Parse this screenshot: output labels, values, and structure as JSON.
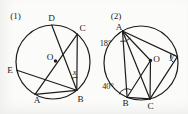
{
  "figure": {
    "background": "#fbfbf9",
    "ink": "#1c1c1c",
    "diagrams": [
      {
        "id": "diagram-1",
        "tag": "(1)",
        "tag_pos": [
          15.5,
          15.5
        ],
        "circle": {
          "cx": 53,
          "cy": 62,
          "r": 37
        },
        "center_dot": [
          55.5,
          61
        ],
        "points": {
          "D": [
            51.7,
            25.0
          ],
          "C": [
            77.3,
            34.1
          ],
          "E": [
            17.0,
            70.3
          ],
          "A": [
            35.1,
            94.4
          ],
          "B": [
            76.8,
            90.3
          ]
        },
        "segments": [
          [
            "D",
            "B"
          ],
          [
            "A",
            "C"
          ],
          [
            "C",
            "B"
          ],
          [
            "E",
            "B"
          ],
          [
            "A",
            "B"
          ]
        ],
        "point_labels": [
          {
            "text": "D",
            "pos": [
              51.5,
              18.0
            ]
          },
          {
            "text": "C",
            "pos": [
              82.5,
              27.5
            ]
          },
          {
            "text": "E",
            "pos": [
              10.0,
              70.0
            ]
          },
          {
            "text": "A",
            "pos": [
              37.0,
              99.5
            ]
          },
          {
            "text": "B",
            "pos": [
              80.5,
              99.0
            ]
          },
          {
            "text": "O",
            "pos": [
              50.0,
              56.5
            ]
          }
        ],
        "angle_marks": [
          {
            "at": "B",
            "from": -113,
            "to": -87,
            "radius": 13,
            "label": "x",
            "label_pos": [
              74.5,
              72.0
            ],
            "italic": true
          }
        ]
      },
      {
        "id": "diagram-2",
        "tag": "(2)",
        "tag_pos": [
          116.0,
          15.5
        ],
        "circle": {
          "cx": 141,
          "cy": 63,
          "r": 37
        },
        "center_dot": [
          150.5,
          60.5
        ],
        "points": {
          "A": [
            122.5,
            31.0
          ],
          "B": [
            127.1,
            97.3
          ],
          "C": [
            150.0,
            98.9
          ],
          "P": [
            177.4,
            56.6
          ],
          "O": [
            150.5,
            60.5
          ]
        },
        "segments": [
          [
            "A",
            "B"
          ],
          [
            "A",
            "C"
          ],
          [
            "A",
            "P"
          ],
          [
            "A",
            "O"
          ],
          [
            "B",
            "O"
          ],
          [
            "B",
            "C"
          ],
          [
            "C",
            "O"
          ],
          [
            "C",
            "P"
          ]
        ],
        "point_labels": [
          {
            "text": "A",
            "pos": [
              119.0,
              26.5
            ]
          },
          {
            "text": "B",
            "pos": [
              125.5,
              102.5
            ]
          },
          {
            "text": "C",
            "pos": [
              150.5,
              105.5
            ]
          },
          {
            "text": "O",
            "pos": [
              156.5,
              59.0
            ]
          }
        ],
        "angle_marks": [
          {
            "at": "A",
            "from": 42,
            "to": 102,
            "radius": 10.5,
            "label": "18°",
            "label_pos": [
              105.5,
              43.0
            ],
            "italic": false
          },
          {
            "at": "B",
            "from": -160,
            "to": -58,
            "radius": 8.5,
            "label": "40°",
            "label_pos": [
              108.0,
              86.0
            ],
            "italic": false
          },
          {
            "at": "P",
            "from": 123,
            "to": 207,
            "radius": 7,
            "label": "y",
            "label_pos": [
              172.0,
              56.5
            ],
            "italic": true
          }
        ]
      }
    ]
  }
}
